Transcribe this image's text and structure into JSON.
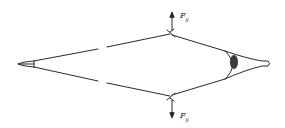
{
  "diagram": {
    "type": "mechanical-force-schematic",
    "forces": [
      {
        "id": "top",
        "symbol": "F",
        "subscript": "y",
        "direction": "up"
      },
      {
        "id": "bottom",
        "symbol": "F",
        "subscript": "y",
        "direction": "down"
      }
    ],
    "colors": {
      "stroke": "#2a2a2a",
      "knot_fill": "#3a3a3a",
      "background": "#ffffff"
    }
  },
  "labels": {
    "top_force_symbol": "F",
    "top_force_sub": "y",
    "bottom_force_symbol": "F",
    "bottom_force_sub": "y"
  }
}
